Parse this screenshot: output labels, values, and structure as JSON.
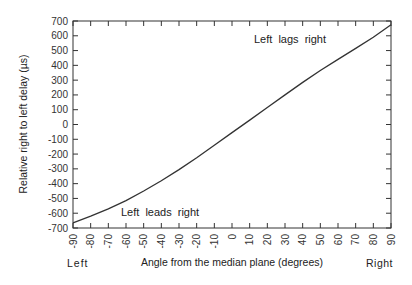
{
  "chart_data": {
    "type": "line",
    "title": "",
    "xlabel": "Angle from the median plane  (degrees)",
    "ylabel": "Relative right to left delay  (µs)",
    "xlim": [
      -90,
      90
    ],
    "ylim": [
      -700,
      700
    ],
    "grid": false,
    "x_ticks": [
      -90,
      -80,
      -70,
      -60,
      -50,
      -40,
      -30,
      -20,
      -10,
      0,
      10,
      20,
      30,
      40,
      50,
      60,
      70,
      80,
      90
    ],
    "y_ticks": [
      -700,
      -600,
      -500,
      -400,
      -300,
      -200,
      -100,
      0,
      100,
      200,
      300,
      400,
      500,
      600,
      700
    ],
    "x_end_labels": {
      "left": "Left",
      "right": "Right"
    },
    "annotations": [
      {
        "text": "Left  lags  right",
        "x": 20,
        "y": 620
      },
      {
        "text": "Left  leads  right",
        "x": -63,
        "y": -640
      }
    ],
    "series": [
      {
        "name": "ITD",
        "x": [
          -90,
          -80,
          -70,
          -60,
          -50,
          -40,
          -30,
          -20,
          -10,
          0,
          10,
          20,
          30,
          40,
          50,
          60,
          70,
          80,
          90
        ],
        "values": [
          -665,
          -620,
          -570,
          -515,
          -450,
          -380,
          -305,
          -225,
          -140,
          -55,
          30,
          115,
          200,
          285,
          365,
          440,
          515,
          590,
          675
        ]
      }
    ]
  }
}
